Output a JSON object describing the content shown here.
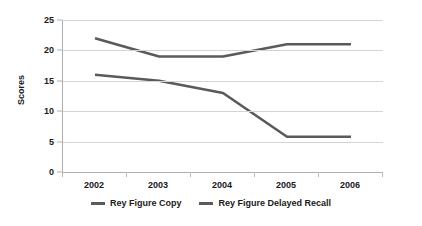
{
  "chart_data": {
    "type": "line",
    "title": "",
    "xlabel": "",
    "ylabel": "Scores",
    "categories": [
      "2002",
      "2003",
      "2004",
      "2005",
      "2006"
    ],
    "series": [
      {
        "name": "Rey Figure Copy",
        "values": [
          22,
          19,
          19,
          21,
          21
        ],
        "color": "#5a5a5a"
      },
      {
        "name": "Rey Figure Delayed Recall",
        "values": [
          16,
          15,
          13,
          5.8,
          5.8
        ],
        "color": "#5a5a5a"
      }
    ],
    "ylim": [
      0,
      25
    ],
    "y_ticks": [
      0,
      5,
      10,
      15,
      20,
      25
    ],
    "grid": true,
    "grid_color": "#d4d4d4",
    "legend_position": "bottom",
    "axis_color": "#b0b0b0",
    "background": "#ffffff",
    "markers": false
  }
}
